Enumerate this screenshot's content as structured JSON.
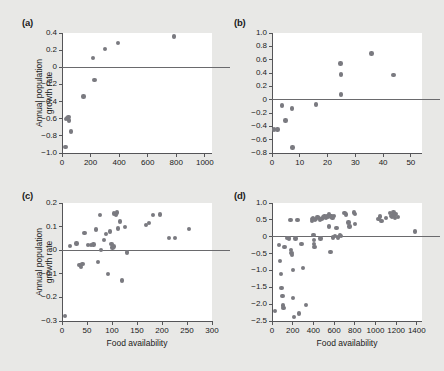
{
  "figure": {
    "background": "#e8e8e6",
    "point_color": "#7a7a80",
    "axis_color": "#555558",
    "shared_ylabel": "Annual population growth rate",
    "shared_xlabel": "Food availability"
  },
  "panels": [
    {
      "tag": "(a)",
      "ylabel": "Annual population\ngrowth rate",
      "xlabel": "",
      "show_xlabel": false
    },
    {
      "tag": "(b)",
      "ylabel": "",
      "xlabel": "",
      "show_xlabel": false
    },
    {
      "tag": "(c)",
      "ylabel": "Annual population\ngrowth rate",
      "xlabel": "Food availability",
      "show_xlabel": true
    },
    {
      "tag": "(d)",
      "ylabel": "",
      "xlabel": "Food availability",
      "show_xlabel": true
    }
  ],
  "chart_data": [
    {
      "panel": "(a)",
      "type": "scatter",
      "title": "(a)",
      "xlabel": "",
      "ylabel": "Annual population growth rate",
      "xlim": [
        0,
        1050
      ],
      "ylim": [
        -1.0,
        0.4
      ],
      "xticks": [
        0,
        200,
        400,
        600,
        800,
        1000
      ],
      "yticks": [
        0.4,
        0.2,
        0,
        -0.2,
        -0.4,
        -0.6,
        -0.8,
        -1.0
      ],
      "ytick_labels": [
        "0.4",
        "0.2",
        "0",
        "−0.2",
        "−0.4",
        "−0.6",
        "−0.8",
        "−1.0"
      ],
      "xtick_labels": [
        "0",
        "200",
        "400",
        "600",
        "800",
        "1000"
      ],
      "grid": false,
      "reference_line_y": 0,
      "points": [
        {
          "x": 25,
          "y": -0.93
        },
        {
          "x": 30,
          "y": -0.6
        },
        {
          "x": 38,
          "y": -0.59
        },
        {
          "x": 45,
          "y": -0.58
        },
        {
          "x": 48,
          "y": -0.62
        },
        {
          "x": 62,
          "y": -0.75
        },
        {
          "x": 150,
          "y": -0.34
        },
        {
          "x": 228,
          "y": -0.15
        },
        {
          "x": 215,
          "y": 0.11
        },
        {
          "x": 300,
          "y": 0.215
        },
        {
          "x": 392,
          "y": 0.285
        },
        {
          "x": 785,
          "y": 0.36
        }
      ]
    },
    {
      "panel": "(b)",
      "type": "scatter",
      "title": "(b)",
      "xlabel": "",
      "ylabel": "",
      "xlim": [
        0,
        54
      ],
      "ylim": [
        -0.8,
        1.0
      ],
      "xticks": [
        0,
        10,
        20,
        30,
        40,
        50
      ],
      "yticks": [
        1.0,
        0.8,
        0.6,
        0.4,
        0.2,
        0,
        -0.2,
        -0.4,
        -0.6,
        -0.8
      ],
      "ytick_labels": [
        "1.0",
        "0.8",
        "0.6",
        "0.4",
        "0.2",
        "0",
        "−0.2",
        "−0.4",
        "−0.6",
        "−0.8"
      ],
      "xtick_labels": [
        "0",
        "10",
        "20",
        "30",
        "40",
        "50"
      ],
      "grid": false,
      "reference_line_y": 0,
      "points": [
        {
          "x": 0.8,
          "y": -0.45
        },
        {
          "x": 2.0,
          "y": -0.45
        },
        {
          "x": 3.6,
          "y": -0.09
        },
        {
          "x": 4.8,
          "y": -0.31
        },
        {
          "x": 7.2,
          "y": -0.13
        },
        {
          "x": 7.4,
          "y": -0.72
        },
        {
          "x": 15.8,
          "y": -0.07
        },
        {
          "x": 24.8,
          "y": 0.08
        },
        {
          "x": 24.8,
          "y": 0.38
        },
        {
          "x": 24.6,
          "y": 0.54
        },
        {
          "x": 35.8,
          "y": 0.69
        },
        {
          "x": 43.8,
          "y": 0.37
        }
      ]
    },
    {
      "panel": "(c)",
      "type": "scatter",
      "title": "(c)",
      "xlabel": "Food availability",
      "ylabel": "Annual population growth rate",
      "xlim": [
        0,
        300
      ],
      "ylim": [
        -0.3,
        0.2
      ],
      "xticks": [
        0,
        50,
        100,
        150,
        200,
        250,
        300
      ],
      "yticks": [
        0.2,
        0.1,
        0,
        -0.1,
        -0.2,
        -0.3
      ],
      "ytick_labels": [
        "0.2",
        "0.1",
        "0",
        "−0.1",
        "−0.2",
        "−0.3"
      ],
      "xtick_labels": [
        "0",
        "50",
        "100",
        "150",
        "200",
        "250",
        "300"
      ],
      "grid": false,
      "reference_line_y": 0,
      "points": [
        {
          "x": 6,
          "y": -0.278
        },
        {
          "x": 16,
          "y": 0.019
        },
        {
          "x": 29,
          "y": 0.028
        },
        {
          "x": 35,
          "y": -0.062
        },
        {
          "x": 38,
          "y": -0.072
        },
        {
          "x": 41,
          "y": -0.058
        },
        {
          "x": 45,
          "y": 0.072
        },
        {
          "x": 52,
          "y": 0.021
        },
        {
          "x": 58,
          "y": 0.023
        },
        {
          "x": 63,
          "y": 0.024
        },
        {
          "x": 68,
          "y": 0.088
        },
        {
          "x": 72,
          "y": -0.049
        },
        {
          "x": 76,
          "y": 0.148
        },
        {
          "x": 78,
          "y": 0.001
        },
        {
          "x": 84,
          "y": 0.043
        },
        {
          "x": 88,
          "y": 0.069
        },
        {
          "x": 92,
          "y": -0.101
        },
        {
          "x": 96,
          "y": 0.079
        },
        {
          "x": 99,
          "y": 0.026
        },
        {
          "x": 101,
          "y": 0.012
        },
        {
          "x": 103,
          "y": 0.015
        },
        {
          "x": 104,
          "y": 0.155
        },
        {
          "x": 108,
          "y": 0.148
        },
        {
          "x": 110,
          "y": 0.16
        },
        {
          "x": 112,
          "y": 0.092
        },
        {
          "x": 116,
          "y": 0.122
        },
        {
          "x": 120,
          "y": -0.128
        },
        {
          "x": 126,
          "y": 0.098
        },
        {
          "x": 130,
          "y": -0.009
        },
        {
          "x": 168,
          "y": 0.108
        },
        {
          "x": 174,
          "y": 0.115
        },
        {
          "x": 182,
          "y": 0.148
        },
        {
          "x": 196,
          "y": 0.152
        },
        {
          "x": 214,
          "y": 0.053
        },
        {
          "x": 226,
          "y": 0.052
        },
        {
          "x": 254,
          "y": 0.089
        }
      ]
    },
    {
      "panel": "(d)",
      "type": "scatter",
      "title": "(d)",
      "xlabel": "Food availability",
      "ylabel": "",
      "xlim": [
        0,
        1450
      ],
      "ylim": [
        -2.5,
        1.0
      ],
      "xticks": [
        0,
        200,
        400,
        600,
        800,
        1000,
        1200,
        1400
      ],
      "yticks": [
        1.0,
        0.5,
        0,
        -0.5,
        -1.0,
        -1.5,
        -2.0,
        -2.5
      ],
      "ytick_labels": [
        "1.0",
        "0.5",
        "0",
        "−0.5",
        "−1.0",
        "−1.5",
        "−2.0",
        "−2.5"
      ],
      "xtick_labels": [
        "0",
        "200",
        "400",
        "600",
        "800",
        "1000",
        "1200",
        "1400"
      ],
      "grid": false,
      "reference_line_y": 0,
      "points": [
        {
          "x": 30,
          "y": -2.21
        },
        {
          "x": 70,
          "y": -0.25
        },
        {
          "x": 78,
          "y": -0.72
        },
        {
          "x": 85,
          "y": -1.11
        },
        {
          "x": 92,
          "y": -1.52
        },
        {
          "x": 100,
          "y": -1.75
        },
        {
          "x": 105,
          "y": -2.04
        },
        {
          "x": 112,
          "y": -2.11
        },
        {
          "x": 120,
          "y": -0.3
        },
        {
          "x": 150,
          "y": -0.03
        },
        {
          "x": 165,
          "y": -0.05
        },
        {
          "x": 180,
          "y": 0.5
        },
        {
          "x": 185,
          "y": -0.4
        },
        {
          "x": 190,
          "y": -0.48
        },
        {
          "x": 195,
          "y": -0.55
        },
        {
          "x": 200,
          "y": -0.98
        },
        {
          "x": 205,
          "y": -1.82
        },
        {
          "x": 215,
          "y": -2.38
        },
        {
          "x": 228,
          "y": -0.05
        },
        {
          "x": 245,
          "y": 0.5
        },
        {
          "x": 262,
          "y": -2.28
        },
        {
          "x": 285,
          "y": -0.22
        },
        {
          "x": 300,
          "y": -0.92
        },
        {
          "x": 330,
          "y": -2.02
        },
        {
          "x": 385,
          "y": 0.47
        },
        {
          "x": 392,
          "y": 0.52
        },
        {
          "x": 398,
          "y": 0.56
        },
        {
          "x": 402,
          "y": 0.05
        },
        {
          "x": 405,
          "y": -0.1
        },
        {
          "x": 408,
          "y": -0.22
        },
        {
          "x": 412,
          "y": -0.3
        },
        {
          "x": 415,
          "y": 0.49
        },
        {
          "x": 425,
          "y": 0.53
        },
        {
          "x": 440,
          "y": 0.58
        },
        {
          "x": 452,
          "y": 0.55
        },
        {
          "x": 465,
          "y": 0.5
        },
        {
          "x": 470,
          "y": -0.05
        },
        {
          "x": 480,
          "y": 0.52
        },
        {
          "x": 495,
          "y": 0.57
        },
        {
          "x": 508,
          "y": 0.6
        },
        {
          "x": 520,
          "y": 0.56
        },
        {
          "x": 530,
          "y": 0.62
        },
        {
          "x": 542,
          "y": 0.58
        },
        {
          "x": 548,
          "y": 0.3
        },
        {
          "x": 552,
          "y": 0.66
        },
        {
          "x": 560,
          "y": 0.62
        },
        {
          "x": 565,
          "y": -0.46
        },
        {
          "x": 575,
          "y": 0.6
        },
        {
          "x": 585,
          "y": 0.55
        },
        {
          "x": 590,
          "y": -0.02
        },
        {
          "x": 600,
          "y": 0.62
        },
        {
          "x": 610,
          "y": 0.03
        },
        {
          "x": 625,
          "y": 0.26
        },
        {
          "x": 640,
          "y": -0.02
        },
        {
          "x": 655,
          "y": 0.05
        },
        {
          "x": 665,
          "y": 0.02
        },
        {
          "x": 700,
          "y": 0.7
        },
        {
          "x": 715,
          "y": 0.66
        },
        {
          "x": 740,
          "y": 0.42
        },
        {
          "x": 748,
          "y": 0.3
        },
        {
          "x": 790,
          "y": 0.72
        },
        {
          "x": 800,
          "y": 0.68
        },
        {
          "x": 805,
          "y": 0.38
        },
        {
          "x": 1030,
          "y": 0.52
        },
        {
          "x": 1045,
          "y": 0.6
        },
        {
          "x": 1060,
          "y": 0.46
        },
        {
          "x": 1100,
          "y": 0.55
        },
        {
          "x": 1140,
          "y": 0.7
        },
        {
          "x": 1155,
          "y": 0.62
        },
        {
          "x": 1160,
          "y": 0.58
        },
        {
          "x": 1175,
          "y": 0.72
        },
        {
          "x": 1185,
          "y": 0.64
        },
        {
          "x": 1190,
          "y": 0.55
        },
        {
          "x": 1200,
          "y": 0.68
        },
        {
          "x": 1215,
          "y": 0.58
        },
        {
          "x": 1385,
          "y": 0.15
        }
      ]
    }
  ]
}
